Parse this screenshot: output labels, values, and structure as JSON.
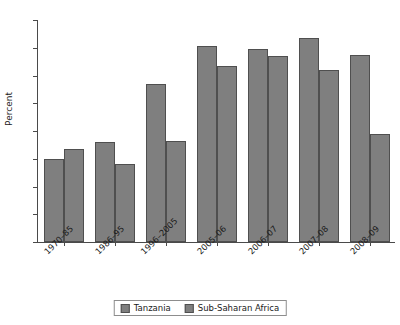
{
  "chart_data": {
    "type": "bar",
    "title": "",
    "xlabel": "",
    "ylabel": "Percent",
    "ylim": [
      0,
      8
    ],
    "yticks": [
      0,
      1,
      2,
      3,
      4,
      5,
      6,
      7,
      8
    ],
    "ytick_labels": [
      "0",
      "1",
      "2",
      "3",
      "4",
      "5",
      "6",
      "7",
      "8"
    ],
    "grid": false,
    "legend_position": "bottom-center",
    "categories": [
      "1970–85",
      "1986–95",
      "1996–2005",
      "2005–06",
      "2006–07",
      "2007–08",
      "2008–09"
    ],
    "series": [
      {
        "name": "Tanzania",
        "color": "#7f7f7f",
        "values": [
          3.0,
          3.6,
          5.7,
          7.05,
          6.95,
          7.35,
          6.75
        ]
      },
      {
        "name": "Sub-Saharan Africa",
        "color": "#7f7f7f",
        "values": [
          3.35,
          2.8,
          3.65,
          6.35,
          6.7,
          6.2,
          3.88
        ]
      }
    ]
  },
  "legend": {
    "items": [
      {
        "label": "Tanzania"
      },
      {
        "label": "Sub-Saharan Africa"
      }
    ]
  }
}
